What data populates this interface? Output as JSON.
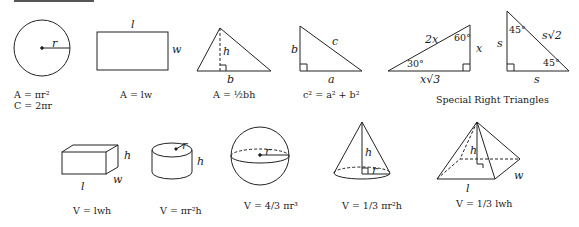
{
  "header": {
    "rule": "reference-rule"
  },
  "shapes_2d": {
    "circle": {
      "radius_label": "r",
      "formula_area": "A = πr²",
      "formula_circumference": "C = 2πr"
    },
    "rectangle": {
      "length_label": "l",
      "width_label": "w",
      "formula_area": "A = lw"
    },
    "triangle": {
      "height_label": "h",
      "base_label": "b",
      "formula_area": "A = ½bh"
    },
    "right_triangle": {
      "leg_b_label": "b",
      "hyp_label": "c",
      "leg_a_label": "a",
      "formula": "c² = a² + b²"
    },
    "triangle_30_60_90": {
      "hyp_label": "2x",
      "short_leg_label": "x",
      "long_leg_label": "x√3",
      "angle_top": "60°",
      "angle_left": "30°"
    },
    "triangle_45_45_90": {
      "leg_vertical_label": "s",
      "hyp_label": "s√2",
      "leg_base_label": "s",
      "angle_top": "45°",
      "angle_right": "45°"
    },
    "special_caption": "Special Right Triangles"
  },
  "shapes_3d": {
    "box": {
      "height_label": "h",
      "length_label": "l",
      "width_label": "w",
      "formula": "V = lwh"
    },
    "cylinder": {
      "radius_label": "r",
      "height_label": "h",
      "formula": "V = πr²h"
    },
    "sphere": {
      "radius_label": "r",
      "formula": "V = 4/3 πr³"
    },
    "cone": {
      "height_label": "h",
      "radius_label": "r",
      "formula": "V = 1/3 πr²h"
    },
    "pyramid": {
      "height_label": "h",
      "length_label": "l",
      "width_label": "w",
      "formula": "V = 1/3 lwh"
    }
  }
}
